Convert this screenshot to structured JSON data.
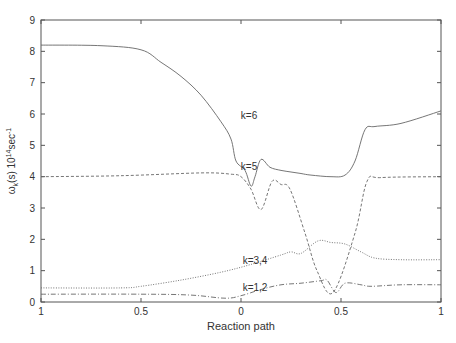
{
  "chart_data": {
    "type": "line",
    "title": "",
    "xlabel": "Reaction path",
    "ylabel": "ω_k(s) 10^14 sec^-1",
    "ylabel_parts": {
      "main": "ω",
      "sub": "k",
      "mid": "(s) 10",
      "sup": "14",
      "unit": "sec",
      "unit_sup": "-1"
    },
    "xlim": [
      -1,
      1
    ],
    "ylim": [
      0,
      9
    ],
    "x_ticks": [
      {
        "pos": -1,
        "label": "1"
      },
      {
        "pos": -0.5,
        "label": "0.5"
      },
      {
        "pos": 0,
        "label": "0"
      },
      {
        "pos": 0.5,
        "label": "0.5"
      },
      {
        "pos": 1,
        "label": "1"
      }
    ],
    "y_ticks": [
      "0",
      "1",
      "2",
      "3",
      "4",
      "5",
      "6",
      "7",
      "8",
      "9"
    ],
    "grid": false,
    "series": [
      {
        "name": "k=6",
        "style": "solid",
        "label_pos": [
          0.04,
          5.85
        ],
        "x": [
          -1,
          -0.7,
          -0.5,
          -0.4,
          -0.3,
          -0.2,
          -0.1,
          -0.05,
          -0.025,
          0.02,
          0.05,
          0.07,
          0.1,
          0.145,
          0.2,
          0.25,
          0.3,
          0.35,
          0.45,
          0.52,
          0.57,
          0.62,
          0.67,
          0.8,
          1.0
        ],
        "values": [
          8.2,
          8.18,
          8.05,
          7.65,
          7.2,
          6.6,
          5.75,
          5.2,
          4.5,
          4.2,
          3.7,
          4.0,
          4.55,
          4.3,
          4.2,
          4.15,
          4.1,
          4.05,
          4.0,
          4.05,
          4.5,
          5.5,
          5.6,
          5.7,
          6.1
        ]
      },
      {
        "name": "k=5",
        "style": "dashed",
        "label_pos": [
          0.04,
          4.2
        ],
        "x": [
          -1,
          -0.6,
          -0.2,
          -0.05,
          0.0,
          0.05,
          0.1,
          0.155,
          0.2,
          0.245,
          0.32,
          0.38,
          0.46,
          0.57,
          0.63,
          0.7,
          1.0
        ],
        "values": [
          4.0,
          4.03,
          4.12,
          4.08,
          4.0,
          3.6,
          2.95,
          3.85,
          3.75,
          3.6,
          2.2,
          1.0,
          0.3,
          2.2,
          3.85,
          3.97,
          4.0
        ]
      },
      {
        "name": "k=3,4",
        "style": "dotted",
        "label_pos": [
          0.07,
          1.2
        ],
        "x": [
          -1,
          -0.6,
          -0.5,
          -0.3,
          -0.1,
          0.05,
          0.2,
          0.25,
          0.3,
          0.385,
          0.45,
          0.52,
          0.6,
          0.67,
          0.8,
          1.0
        ],
        "values": [
          0.45,
          0.45,
          0.5,
          0.7,
          0.95,
          1.2,
          1.5,
          1.6,
          1.55,
          1.95,
          1.9,
          1.85,
          1.6,
          1.4,
          1.35,
          1.35
        ]
      },
      {
        "name": "k=1,2",
        "style": "dash-dot",
        "label_pos": [
          0.07,
          0.35
        ],
        "x": [
          -1,
          -0.5,
          -0.25,
          -0.08,
          0.0,
          0.1,
          0.2,
          0.3,
          0.4,
          0.43,
          0.475,
          0.52,
          0.6,
          0.65,
          0.8,
          1.0
        ],
        "values": [
          0.25,
          0.25,
          0.22,
          0.12,
          0.2,
          0.4,
          0.55,
          0.6,
          0.68,
          0.7,
          0.3,
          0.6,
          0.55,
          0.5,
          0.55,
          0.55
        ]
      }
    ]
  }
}
